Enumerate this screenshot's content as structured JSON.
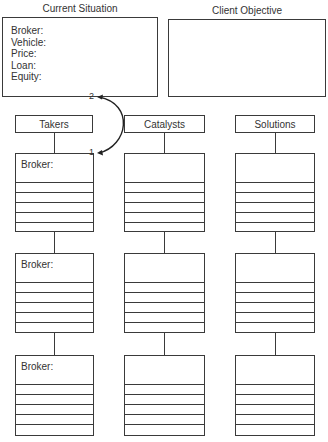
{
  "current_situation": {
    "title": "Current Situation",
    "fields": [
      "Broker:",
      "Vehicle:",
      "Price:",
      "Loan:",
      "Equity:"
    ]
  },
  "client_objective": {
    "title": "Client Objective"
  },
  "columns": [
    {
      "header": "Takers",
      "box_label": "Broker:"
    },
    {
      "header": "Catalysts",
      "box_label": ""
    },
    {
      "header": "Solutions",
      "box_label": ""
    }
  ],
  "rows_per_box": 5,
  "box_tiers": 3,
  "arrow": {
    "start_label": "1",
    "end_label": "2"
  }
}
